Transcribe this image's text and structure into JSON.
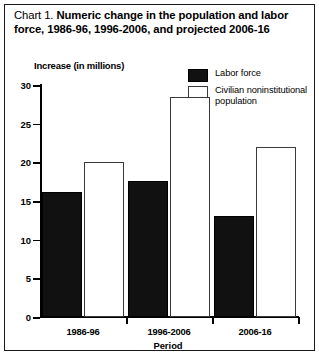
{
  "title": {
    "prefix": "Chart 1.",
    "text": "Numeric change in the population and labor force, 1986-96, 1996-2006, and projected 2006-16"
  },
  "axis": {
    "ylabel": "Increase (in millions)",
    "xlabel": "Period"
  },
  "legend": {
    "items": [
      {
        "label": "Labor force",
        "color": "#111111",
        "style": "filled"
      },
      {
        "label": "Civilian noninstitutional population",
        "color": "#ffffff",
        "style": "outline"
      }
    ]
  },
  "chart_data": {
    "type": "bar",
    "title": "Chart 1. Numeric change in the population and labor force, 1986-96, 1996-2006, and projected 2006-16",
    "xlabel": "Period",
    "ylabel": "Increase (in millions)",
    "categories": [
      "1986-96",
      "1996-2006",
      "2006-16"
    ],
    "series": [
      {
        "name": "Labor force",
        "values": [
          16.2,
          17.6,
          13.0
        ],
        "color": "#111111"
      },
      {
        "name": "Civilian noninstitutional population",
        "values": [
          20.0,
          28.5,
          22.0
        ],
        "color": "#ffffff"
      }
    ],
    "ylim": [
      0,
      30
    ],
    "yticks": [
      0,
      5,
      10,
      15,
      20,
      25,
      30
    ],
    "ytick_labels": [
      "0",
      "5",
      "10",
      "15",
      "20",
      "25",
      "30"
    ],
    "grid": false,
    "legend_position": "top-right"
  }
}
